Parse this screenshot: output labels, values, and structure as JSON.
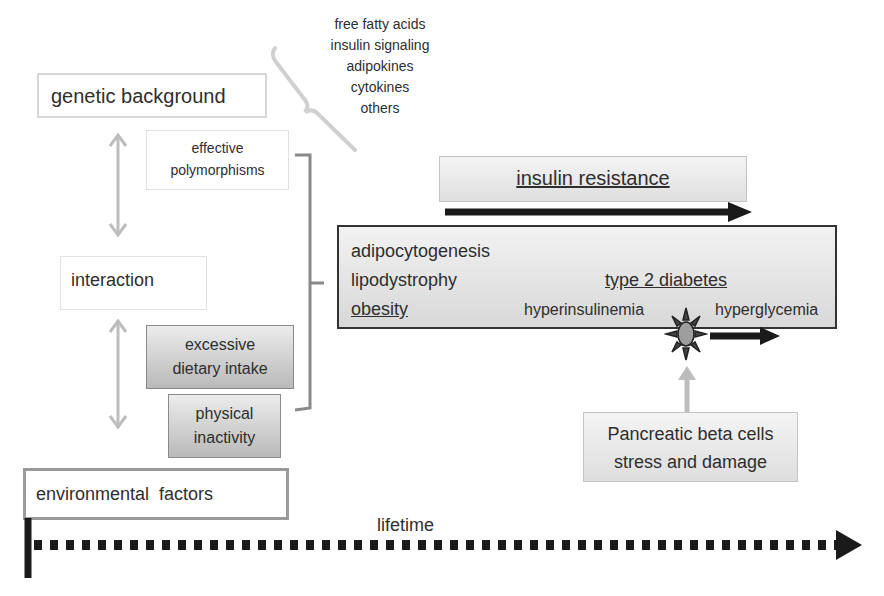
{
  "left": {
    "genetic_background": "genetic background",
    "effective_polymorphisms": [
      "effective",
      "polymorphisms"
    ],
    "interaction": "interaction",
    "excessive_dietary_intake": [
      "excessive",
      "dietary intake"
    ],
    "physical_inactivity": [
      "physical",
      "inactivity"
    ],
    "environmental_factors": "environmental  factors"
  },
  "mediators": [
    "free fatty acids",
    "insulin signaling",
    "adipokines",
    "cytokines",
    "others"
  ],
  "insulin_resistance": "insulin resistance",
  "main_box": {
    "adipocytogenesis": "adipocytogenesis",
    "lipodystrophy": "lipodystrophy",
    "obesity": "obesity",
    "type2_diabetes": "type 2 diabetes",
    "hyperinsulinemia": "hyperinsulinemia",
    "hyperglycemia": "hyperglycemia"
  },
  "pancreatic": [
    "Pancreatic beta cells",
    "stress and damage"
  ],
  "timeline": {
    "label": "lifetime"
  },
  "colors": {
    "arrow_gray": "#bdbdbd",
    "arrow_dark": "#1a1a1a",
    "bracket": "#8a8a8a"
  }
}
